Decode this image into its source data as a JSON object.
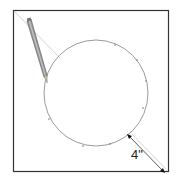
{
  "diagram": {
    "dimension_label": "4\"",
    "colors": {
      "square_stroke": "#333333",
      "circle_stroke": "#9a9a9a",
      "guide_line": "#c8c8c8",
      "pencil_body": "#8a8a8a",
      "dimension": "#333333"
    }
  }
}
